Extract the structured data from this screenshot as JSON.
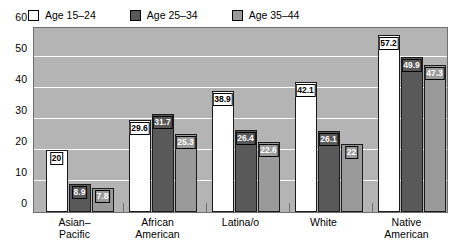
{
  "chart_data": {
    "type": "bar",
    "title": "",
    "subtitle": "",
    "xlabel": "",
    "ylabel": "",
    "ylim": [
      0,
      60
    ],
    "ytick_labels": [
      "60",
      "50",
      "40",
      "30",
      "20",
      "10",
      "0"
    ],
    "ytick_values": [
      60,
      50,
      40,
      30,
      20,
      10,
      0
    ],
    "grid": true,
    "grid_axis": "y",
    "legend_position": "top-left",
    "categories": [
      "Asian–\nPacific",
      "African\nAmerican",
      "Latina/o",
      "White",
      "Native\nAmerican"
    ],
    "category_names": [
      "Asian–Pacific",
      "African American",
      "Latina/o",
      "White",
      "Native American"
    ],
    "series": [
      {
        "name": "Age 15–24",
        "color": "#ffffff",
        "label_style": "light",
        "values": [
          20,
          29.6,
          38.9,
          42.1,
          57.2
        ],
        "value_labels": [
          "20",
          "29.6",
          "38.9",
          "42.1",
          "57.2"
        ]
      },
      {
        "name": "Age 25–34",
        "color": "#595959",
        "label_style": "dark",
        "values": [
          8.9,
          31.7,
          26.4,
          26.1,
          49.9
        ],
        "value_labels": [
          "8.9",
          "31.7",
          "26.4",
          "26.1",
          "49.9"
        ]
      },
      {
        "name": "Age 35–44",
        "color": "#9a9a9a",
        "label_style": "mid",
        "values": [
          7.8,
          25.3,
          22.6,
          22,
          47.3
        ],
        "value_labels": [
          "7.8",
          "25.3",
          "22.6",
          "22",
          "47.3"
        ]
      }
    ],
    "colors": {
      "plot_background": "#b4b4b4",
      "gridline": "#ffffff",
      "axis": "#6e6e6e",
      "bar_border": "#1a1a1a",
      "text": "#000000"
    }
  },
  "legend": {
    "items": [
      {
        "label": "Age 15–24",
        "swatch": "#ffffff"
      },
      {
        "label": "Age 25–34",
        "swatch": "#595959"
      },
      {
        "label": "Age 35–44",
        "swatch": "#9a9a9a"
      }
    ]
  }
}
